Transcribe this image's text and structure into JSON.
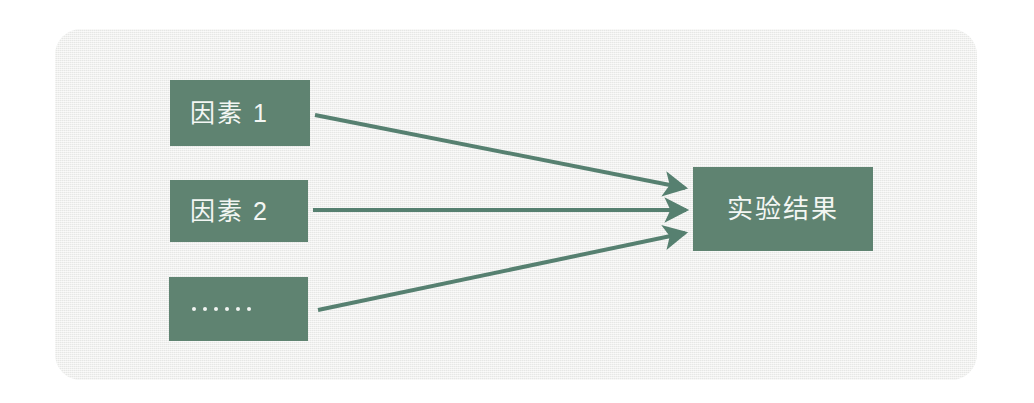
{
  "diagram": {
    "title_text": "",
    "panel": {
      "background_color": "#ecedeb",
      "corner_radius_px": 26
    },
    "accent_color": "#5f8371",
    "label_color": "#f3f6f3",
    "factors": [
      {
        "id": "factor-1",
        "label": "因素 1",
        "kind": "text"
      },
      {
        "id": "factor-2",
        "label": "因素 2",
        "kind": "text"
      },
      {
        "id": "factor-3",
        "label": "......",
        "kind": "dots",
        "dot_count": 6
      }
    ],
    "result": {
      "id": "result",
      "label": "实验结果"
    },
    "connectors": [
      {
        "from": "factor-1",
        "to": "result",
        "style": "arrow",
        "direction": "down-right"
      },
      {
        "from": "factor-2",
        "to": "result",
        "style": "arrow",
        "direction": "horizontal"
      },
      {
        "from": "factor-3",
        "to": "result",
        "style": "arrow",
        "direction": "up-right"
      }
    ]
  }
}
